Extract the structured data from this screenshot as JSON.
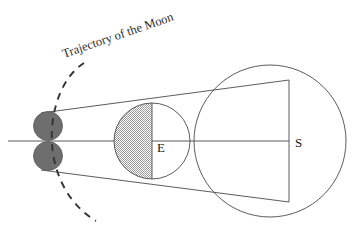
{
  "figure": {
    "title": "Trajectory of the Moon",
    "width": 359,
    "height": 229,
    "background_color": "#ffffff"
  },
  "annotations": {
    "trajectory_label": "Trajectory of the Moon",
    "earth_label": "E",
    "sun_label": "S"
  },
  "colors": {
    "stroke": "#4a4a4a",
    "axis": "#5a5a5a",
    "moon_fill": "#6e6e6e",
    "moon_stroke": "#5a5a5a",
    "hatch_light": "#ffffff",
    "hatch_dark": "#9a9a9a",
    "dashed_stroke": "#333333",
    "text": "#1a1a1a"
  },
  "geometry": {
    "axis": {
      "x1": 8,
      "y1": 141,
      "x2": 289,
      "y2": 141
    },
    "moon_upper": {
      "cx": 48,
      "cy": 126,
      "r": 14.5
    },
    "moon_lower": {
      "cx": 48,
      "cy": 156,
      "r": 14.5
    },
    "earth": {
      "cx": 152,
      "cy": 141,
      "r": 38
    },
    "earth_terminator": {
      "x": 152,
      "y1": 103,
      "y2": 179
    },
    "sun": {
      "cx": 270,
      "cy": 141,
      "r": 76
    },
    "sun_chord": {
      "x": 289,
      "y1": 80,
      "y2": 202
    },
    "tangent_upper": {
      "x1": 41,
      "y1": 113,
      "x2": 289,
      "y2": 80
    },
    "tangent_lower": {
      "x1": 41,
      "y1": 170,
      "x2": 289,
      "y2": 202
    },
    "trajectory_arc": {
      "start_x": 84,
      "start_y": 63,
      "end_x": 96,
      "end_y": 221,
      "bulge_x": 14
    },
    "label_rotation_deg": -19
  }
}
